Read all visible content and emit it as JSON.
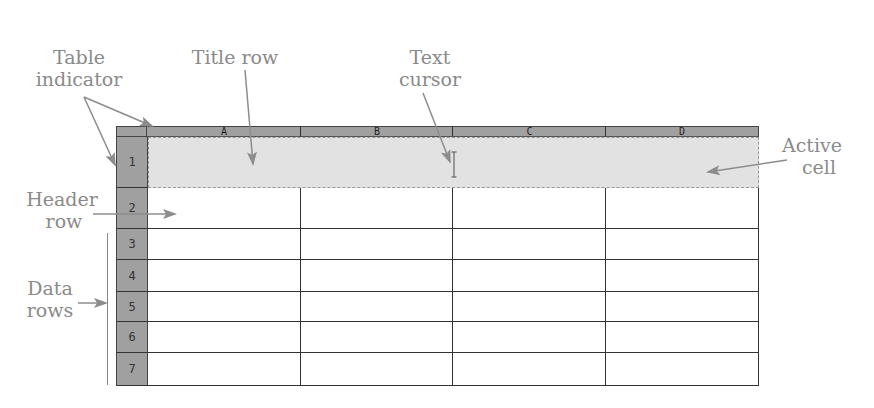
{
  "labels": {
    "table_indicator": [
      "Table",
      "indicator"
    ],
    "title_row": "Title row",
    "text_cursor": [
      "Text",
      "cursor"
    ],
    "active_cell": [
      "Active",
      "cell"
    ],
    "header_row": [
      "Header",
      "row"
    ],
    "data_rows": [
      "Data",
      "rows"
    ]
  },
  "table": {
    "columns": [
      "A",
      "B",
      "C",
      "D"
    ],
    "rows": [
      "1",
      "2",
      "3",
      "4",
      "5",
      "6",
      "7"
    ]
  },
  "colors": {
    "label_gray": "#8a8a8a",
    "header_gray": "#a0a0a0",
    "active_fill": "#e2e2e2",
    "arrow_gray": "#8c8c8c"
  }
}
